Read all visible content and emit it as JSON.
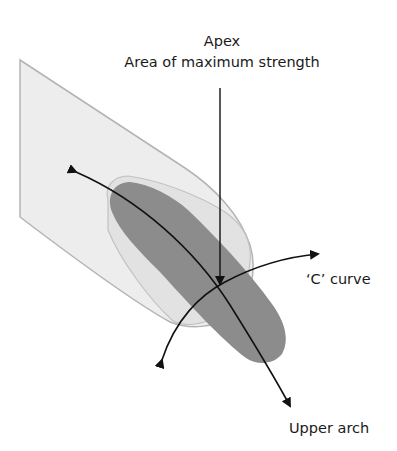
{
  "diagram": {
    "labels": {
      "apex": "Apex",
      "apex_sub": "Area of maximum strength",
      "c_curve": "‘C’ curve",
      "upper_arch": "Upper arch"
    },
    "colors": {
      "background": "#ffffff",
      "finger_fill": "#ededed",
      "finger_edge": "#b4b4b4",
      "nail_fill": "#e2e2e2",
      "nail_edge": "#c2c2c2",
      "apex_band_fill": "#8c8c8c",
      "arrow": "#111111",
      "text": "#1a1a1a"
    },
    "arrows": {
      "apex_pointer": {
        "from": [
          220,
          88
        ],
        "to": [
          220,
          286
        ]
      },
      "upper_arch": {
        "start": [
          73,
          170
        ],
        "end": [
          292,
          410
        ],
        "through": [
          220,
          287
        ]
      },
      "c_curve": {
        "start": [
          160,
          364
        ],
        "end": [
          322,
          254
        ],
        "through": [
          220,
          287
        ]
      }
    }
  }
}
